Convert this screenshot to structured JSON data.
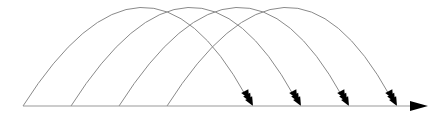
{
  "diagram": {
    "type": "jump-arcs-on-number-line",
    "baseline": {
      "x_start": 23,
      "x_end": 428,
      "y": 106,
      "color": "#9a9a9a",
      "arrowhead_color": "#000000"
    },
    "arc_color": "#8a8a8a",
    "arrow_color": "#000000",
    "arc_apex_y": 10,
    "arcs": [
      {
        "from_x": 23,
        "to_x": 252
      },
      {
        "from_x": 71,
        "to_x": 300
      },
      {
        "from_x": 119,
        "to_x": 348
      },
      {
        "from_x": 167,
        "to_x": 396
      }
    ]
  }
}
